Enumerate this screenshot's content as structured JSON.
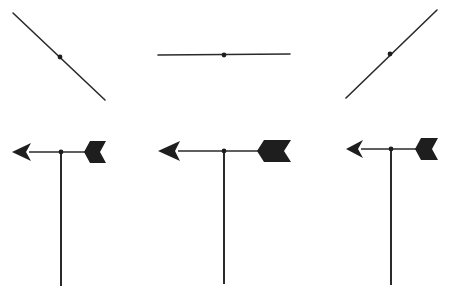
{
  "diagram": {
    "title": "",
    "stroke_color": "#2a2a2a",
    "fill_color": "#1e1e1e",
    "background": "#ffffff",
    "top_views": [
      {
        "name": "top-view-1",
        "x1": 13,
        "y1": 13,
        "x2": 105,
        "y2": 100,
        "pivot": [
          60,
          57
        ]
      },
      {
        "name": "top-view-2",
        "x1": 158,
        "y1": 55,
        "x2": 290,
        "y2": 54,
        "pivot": [
          224,
          55
        ]
      },
      {
        "name": "top-view-3",
        "x1": 346,
        "y1": 98,
        "x2": 437,
        "y2": 10,
        "pivot": [
          390,
          54
        ]
      }
    ],
    "vanes": [
      {
        "name": "vane-1",
        "tip_x": 12,
        "head_len": 19,
        "head_half": 9,
        "y": 152,
        "tail_x1": 84,
        "tail_x2": 106,
        "tail_half": 11,
        "notch": 6,
        "post_x": 61,
        "post_bottom": 286
      },
      {
        "name": "vane-2",
        "tip_x": 158,
        "head_len": 22,
        "head_half": 10,
        "y": 151,
        "tail_x1": 257,
        "tail_x2": 291,
        "tail_half": 11,
        "notch": 7,
        "post_x": 224,
        "post_bottom": 284
      },
      {
        "name": "vane-3",
        "tip_x": 346,
        "head_len": 17,
        "head_half": 9,
        "y": 149,
        "tail_x1": 415,
        "tail_x2": 438,
        "tail_half": 11,
        "notch": 6,
        "post_x": 391,
        "post_bottom": 285
      }
    ]
  }
}
